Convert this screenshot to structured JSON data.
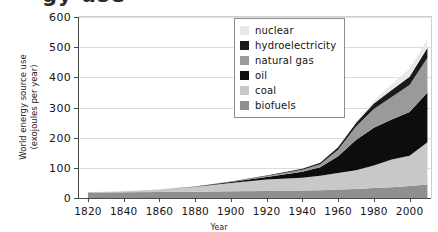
{
  "title_fragment": "gy use",
  "axes": {
    "ylabel_line1": "World energy source use",
    "ylabel_line2": "(exojoules per year)",
    "xlabel": "Year"
  },
  "legend": {
    "items": [
      {
        "label": "nuclear",
        "color": "#e8e8e8"
      },
      {
        "label": "hydroelectricity",
        "color": "#1a1a1a"
      },
      {
        "label": "natural gas",
        "color": "#9a9a9a"
      },
      {
        "label": "oil",
        "color": "#0d0d0d"
      },
      {
        "label": "coal",
        "color": "#c8c8c8"
      },
      {
        "label": "biofuels",
        "color": "#8f8f8f"
      }
    ]
  },
  "chart_data": {
    "type": "area",
    "title": "World energy source use",
    "xlabel": "Year",
    "ylabel": "World energy source use (exojoules per year)",
    "xlim": [
      1815,
      2012
    ],
    "ylim": [
      0,
      600
    ],
    "xticks": [
      1820,
      1840,
      1860,
      1880,
      1900,
      1920,
      1940,
      1960,
      1980,
      2000
    ],
    "yticks": [
      0,
      100,
      200,
      300,
      400,
      500,
      600
    ],
    "grid": "horizontal",
    "legend_position": "top-right",
    "stacked": true,
    "stack_order_bottom_to_top": [
      "biofuels",
      "coal",
      "oil",
      "natural gas",
      "hydroelectricity",
      "nuclear"
    ],
    "x": [
      1820,
      1840,
      1860,
      1880,
      1900,
      1920,
      1940,
      1950,
      1960,
      1970,
      1980,
      1990,
      2000,
      2010
    ],
    "series": [
      {
        "name": "biofuels",
        "color": "#8f8f8f",
        "values": [
          18,
          19,
          20,
          21,
          22,
          23,
          25,
          26,
          28,
          30,
          33,
          36,
          40,
          45
        ]
      },
      {
        "name": "coal",
        "color": "#c8c8c8",
        "values": [
          1,
          3,
          8,
          16,
          28,
          38,
          42,
          48,
          55,
          62,
          75,
          92,
          100,
          140
        ]
      },
      {
        "name": "oil",
        "color": "#0d0d0d",
        "values": [
          0,
          0,
          0,
          1,
          3,
          9,
          20,
          28,
          55,
          100,
          125,
          132,
          145,
          165
        ]
      },
      {
        "name": "natural gas",
        "color": "#9a9a9a",
        "values": [
          0,
          0,
          0,
          0,
          1,
          3,
          7,
          10,
          22,
          45,
          62,
          75,
          90,
          115
        ]
      },
      {
        "name": "hydroelectricity",
        "color": "#1a1a1a",
        "values": [
          0,
          0,
          0,
          0,
          1,
          2,
          3,
          5,
          8,
          12,
          18,
          23,
          27,
          33
        ]
      },
      {
        "name": "nuclear",
        "color": "#e8e8e8",
        "values": [
          0,
          0,
          0,
          0,
          0,
          0,
          0,
          0,
          1,
          3,
          9,
          20,
          26,
          30
        ]
      }
    ],
    "totals": [
      19,
      22,
      28,
      38,
      55,
      75,
      97,
      117,
      169,
      252,
      322,
      378,
      428,
      528
    ]
  }
}
